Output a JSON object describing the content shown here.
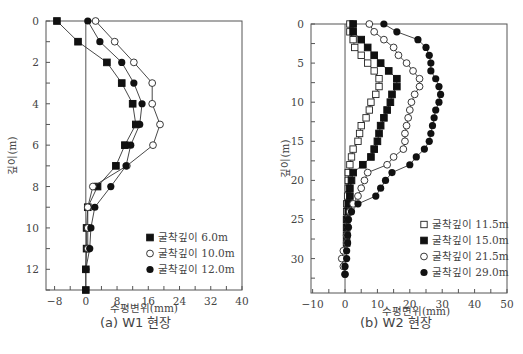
{
  "chart_data": [
    {
      "type": "line",
      "title": "(a) W1 현장",
      "xlabel": "수평변위(mm)",
      "ylabel": "깊이(m)",
      "xlim": [
        -10,
        40
      ],
      "ylim": [
        13,
        0
      ],
      "x_ticks": [
        -8,
        0,
        8,
        16,
        24,
        32,
        40
      ],
      "y_ticks": [
        0,
        2,
        4,
        6,
        8,
        10,
        12
      ],
      "grid": false,
      "legend_position": "lower right",
      "series": [
        {
          "name": "굴착깊이 6.0m",
          "marker": "filled-square",
          "depth": [
            0,
            1,
            2,
            3,
            4,
            5,
            6,
            7,
            8,
            9,
            10,
            11,
            12,
            13
          ],
          "values": [
            -7.4,
            -2.0,
            5.4,
            9.2,
            12.0,
            12.8,
            10.0,
            7.7,
            3.0,
            0.5,
            0.2,
            0.2,
            0.0,
            0.0
          ]
        },
        {
          "name": "굴착깊이 10.0m",
          "marker": "open-circle",
          "depth": [
            0,
            1,
            2,
            3,
            4,
            5,
            6,
            7,
            8,
            9,
            10,
            11
          ],
          "values": [
            2.5,
            7.4,
            12.3,
            17.0,
            17.0,
            19.0,
            17.2,
            10.5,
            1.8,
            0.5,
            0.5,
            0.5
          ]
        },
        {
          "name": "굴착깊이 12.0m",
          "marker": "filled-circle",
          "depth": [
            0,
            1,
            2,
            3,
            4,
            5,
            6,
            7,
            8,
            9,
            10,
            11,
            12
          ],
          "values": [
            0.5,
            3.6,
            9.2,
            12.3,
            14.4,
            13.8,
            11.5,
            10.3,
            6.4,
            2.3,
            1.3,
            1.0,
            0.0
          ]
        }
      ]
    },
    {
      "type": "line",
      "title": "(b) W2 현장",
      "xlabel": "수평변위(mm)",
      "ylabel": "깊이(m)",
      "xlim": [
        -10,
        50
      ],
      "ylim": [
        34,
        0
      ],
      "x_ticks": [
        -10,
        0,
        10,
        20,
        30,
        40,
        50
      ],
      "y_ticks": [
        0,
        5,
        10,
        15,
        20,
        25,
        30
      ],
      "grid": false,
      "legend_position": "lower right",
      "series": [
        {
          "name": "굴착깊이 11.5m",
          "marker": "open-square",
          "depth": [
            0,
            1,
            2,
            3,
            4,
            5,
            6,
            7,
            8,
            9,
            10,
            11,
            12,
            13,
            14,
            15,
            16,
            17,
            18,
            19,
            20,
            21,
            22,
            23,
            24
          ],
          "values": [
            1.5,
            1.5,
            2.5,
            3.0,
            5.0,
            7.0,
            9.0,
            10.5,
            10.5,
            9.5,
            8.0,
            7.5,
            6.5,
            5.0,
            4.5,
            4.0,
            2.5,
            2.0,
            1.5,
            1.0,
            1.0,
            1.0,
            0.8,
            0.5,
            0.5
          ]
        },
        {
          "name": "굴착깊이 15.0m",
          "marker": "filled-square",
          "depth": [
            0,
            1,
            2,
            3,
            4,
            5,
            6,
            7,
            8,
            9,
            10,
            11,
            12,
            13,
            14,
            15,
            16,
            17,
            18,
            19,
            20,
            21,
            22,
            23,
            24,
            25,
            26,
            27,
            28
          ],
          "values": [
            2.5,
            2.5,
            5.0,
            7.0,
            9.0,
            11.0,
            13.5,
            16.0,
            16.0,
            14.5,
            14.0,
            13.0,
            12.0,
            11.0,
            10.5,
            10.0,
            9.0,
            8.0,
            5.5,
            2.5,
            2.0,
            1.5,
            1.5,
            1.0,
            1.0,
            0.5,
            0.5,
            0.5,
            0.5
          ]
        },
        {
          "name": "굴착깊이 21.5m",
          "marker": "open-circle",
          "depth": [
            0,
            1,
            2,
            3,
            4,
            5,
            6,
            7,
            8,
            9,
            10,
            11,
            12,
            13,
            14,
            15,
            16,
            17,
            18,
            19,
            20,
            21,
            22,
            23,
            24,
            25,
            26,
            27,
            28,
            29,
            30,
            31,
            32
          ],
          "values": [
            7.5,
            9.0,
            12.0,
            15.0,
            16.5,
            19.0,
            21.0,
            23.0,
            23.0,
            21.5,
            20.5,
            20.0,
            19.5,
            19.0,
            18.5,
            18.5,
            18.0,
            15.0,
            13.0,
            7.0,
            6.0,
            5.0,
            4.0,
            2.5,
            1.5,
            1.0,
            1.0,
            0.5,
            0.5,
            -0.5,
            -1.0,
            -0.5,
            0.0
          ]
        },
        {
          "name": "굴착깊이 29.0m",
          "marker": "filled-circle",
          "depth": [
            0,
            1,
            2,
            3,
            4,
            5,
            6,
            7,
            8,
            9,
            10,
            11,
            12,
            13,
            14,
            15,
            16,
            17,
            18,
            19,
            20,
            21,
            22,
            23,
            24,
            25,
            26,
            27,
            28,
            29,
            30,
            31,
            32
          ],
          "values": [
            12.0,
            16.0,
            22.5,
            25.0,
            26.0,
            26.5,
            26.5,
            28.0,
            29.0,
            29.5,
            29.0,
            28.0,
            27.5,
            27.0,
            26.5,
            26.0,
            24.5,
            22.0,
            20.0,
            14.5,
            12.5,
            11.0,
            9.5,
            4.0,
            2.0,
            1.0,
            1.0,
            0.8,
            0.8,
            0.5,
            0.5,
            0.0,
            0.0
          ]
        }
      ]
    }
  ],
  "charts": {
    "left": {
      "caption": "(a) W1 현장",
      "xlabel": "수평변위(mm)",
      "ylabel": "깊이(m)",
      "x_ticks": [
        "-8",
        "0",
        "8",
        "16",
        "24",
        "32",
        "40"
      ],
      "y_ticks": [
        "0",
        "2",
        "4",
        "6",
        "8",
        "10",
        "12"
      ],
      "legend": [
        "굴착깊이 6.0m",
        "굴착깊이 10.0m",
        "굴착깊이 12.0m"
      ]
    },
    "right": {
      "caption": "(b) W2 현장",
      "xlabel": "수평변위(mm)",
      "ylabel": "깊이(m)",
      "x_ticks": [
        "-10",
        "0",
        "10",
        "20",
        "30",
        "40",
        "50"
      ],
      "y_ticks": [
        "0",
        "5",
        "10",
        "15",
        "20",
        "25",
        "30"
      ],
      "legend": [
        "굴착깊이 11.5m",
        "굴착깊이 15.0m",
        "굴착깊이 21.5m",
        "굴착깊이 29.0m"
      ]
    }
  },
  "figure_caption_fragment": "그림 ... 깊이별 수평변위"
}
